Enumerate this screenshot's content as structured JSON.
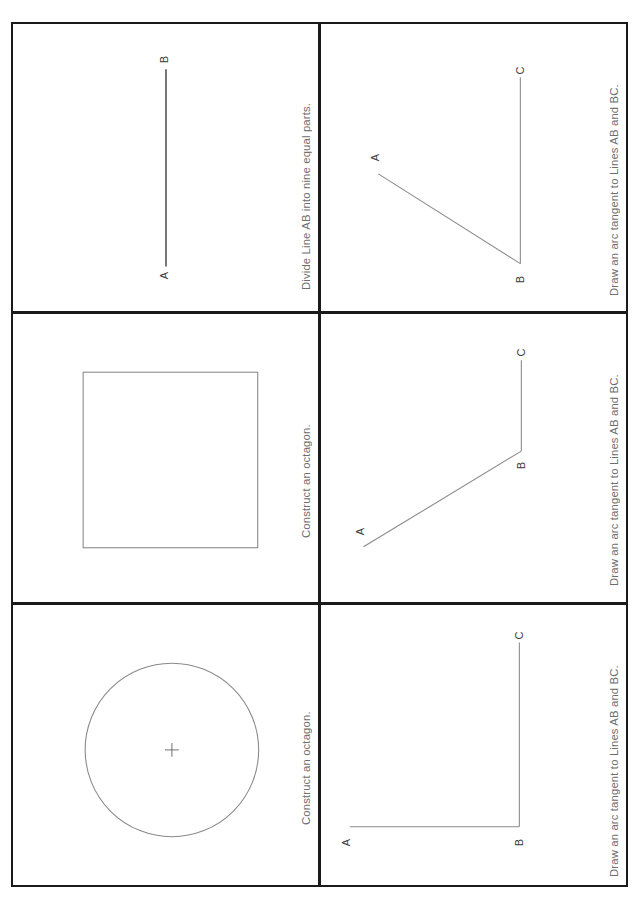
{
  "sheet": {
    "orientation": "rotated-90-ccw",
    "columns": 2,
    "rows": 3,
    "background_color": "#ffffff",
    "border_color": "#1a1a1a",
    "caption_color": "#6d6d6d",
    "line_color": "#6f6f6f",
    "heavy_line_color": "#2a2a2a"
  },
  "panels": [
    {
      "id": "panel-1",
      "caption": "Divide Line AB into nine equal parts.",
      "figure": "line-segment",
      "labels": {
        "a": "A",
        "b": "B"
      }
    },
    {
      "id": "panel-2",
      "caption": "Construct an octagon.",
      "figure": "square",
      "labels": {}
    },
    {
      "id": "panel-3",
      "caption": "Construct an octagon.",
      "figure": "circle-with-center-mark",
      "labels": {}
    },
    {
      "id": "panel-4",
      "caption": "Draw an arc tangent to Lines AB and BC.",
      "figure": "obtuse-angle",
      "labels": {
        "a": "A",
        "b": "B",
        "c": "C"
      }
    },
    {
      "id": "panel-5",
      "caption": "Draw an arc tangent to Lines AB and BC.",
      "figure": "acute-angle",
      "labels": {
        "a": "A",
        "b": "B",
        "c": "C"
      }
    },
    {
      "id": "panel-6",
      "caption": "Draw an arc tangent to Lines AB and BC.",
      "figure": "right-angle",
      "labels": {
        "a": "A",
        "b": "B",
        "c": "C"
      }
    }
  ]
}
